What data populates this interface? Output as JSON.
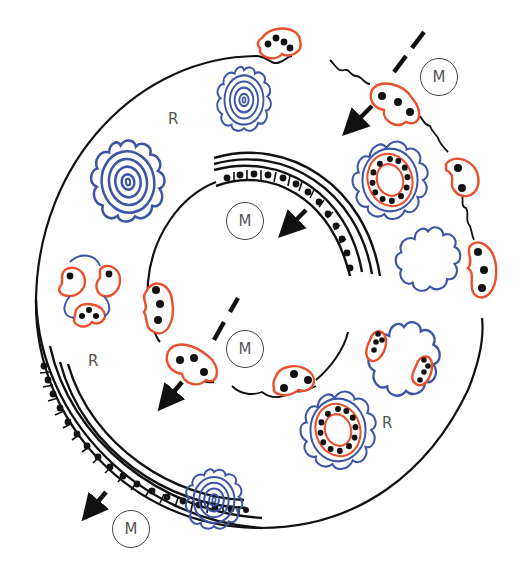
{
  "diagram": {
    "title": "",
    "colors": {
      "outline": "#111111",
      "red_cell": "#e8502e",
      "blue_structure": "#3d56a6",
      "label_text": "#555555"
    },
    "labels": {
      "m_top_right": "M",
      "m_inner_upper": "M",
      "m_inner_lower": "M",
      "m_bottom_left": "M",
      "r_top": "R",
      "r_left": "R",
      "r_bottom_right": "R"
    },
    "elements": {
      "outer_membrane": "outer-ring",
      "inner_membrane": "inner-ring",
      "epithelial_layers": [
        "inner-epithelium-arc",
        "outer-epithelium-arc"
      ],
      "concentric_blue_rosettes": 4,
      "blue_rosettes_with_red_ring": 2,
      "blue_wavy_empty_blobs": 2,
      "red_cell_clusters": 12,
      "solid_arrows": 4,
      "dashed_arrows": 2
    }
  }
}
